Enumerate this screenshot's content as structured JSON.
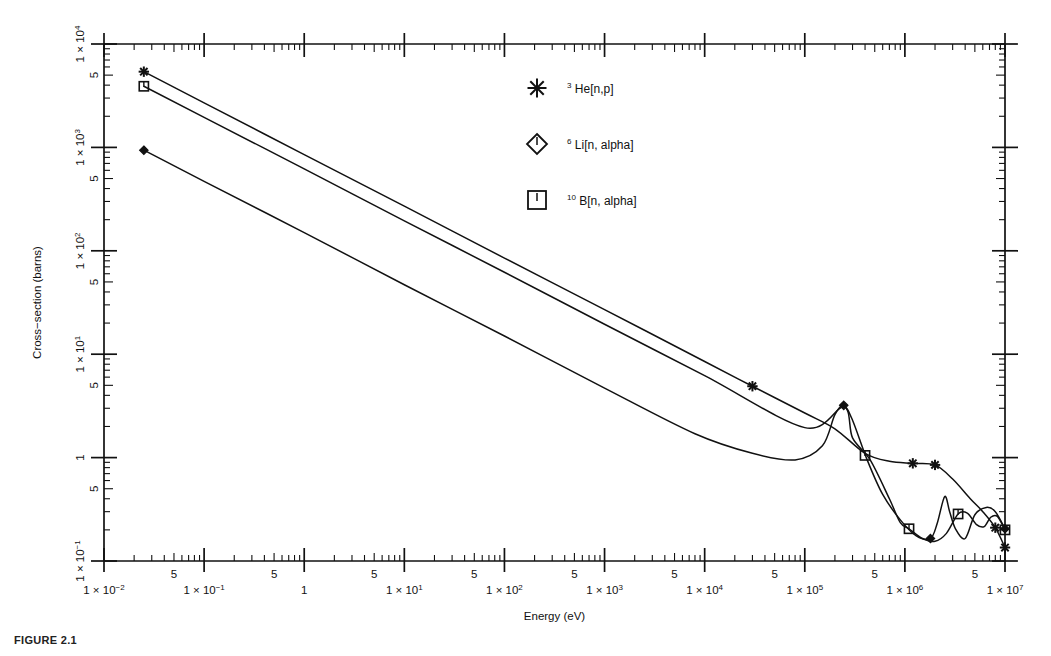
{
  "figure": {
    "caption": "FIGURE 2.1"
  },
  "axes": {
    "x": {
      "title": "Energy  (eV)",
      "min_exp": -2,
      "max_exp": 7,
      "scale": "log",
      "decade_labels": [
        {
          "exp": -2,
          "text": "1 × 10",
          "sup": "−2"
        },
        {
          "exp": -1,
          "text": "1 × 10",
          "sup": "−1"
        },
        {
          "exp": 0,
          "text": "1",
          "sup": ""
        },
        {
          "exp": 1,
          "text": "1 × 10",
          "sup": "1"
        },
        {
          "exp": 2,
          "text": "1 × 10",
          "sup": "2"
        },
        {
          "exp": 3,
          "text": "1 × 10",
          "sup": "3"
        },
        {
          "exp": 4,
          "text": "1 × 10",
          "sup": "4"
        },
        {
          "exp": 5,
          "text": "1 × 10",
          "sup": "5"
        },
        {
          "exp": 6,
          "text": "1 × 10",
          "sup": "6"
        },
        {
          "exp": 7,
          "text": "1 × 10",
          "sup": "7"
        }
      ],
      "minor_label": "5"
    },
    "y": {
      "title": "Cross−section (barns)",
      "min_exp": -1,
      "max_exp": 4,
      "scale": "log",
      "decade_labels": [
        {
          "exp": 4,
          "text": "1 × 10",
          "sup": "4"
        },
        {
          "exp": 3,
          "text": "1 × 10",
          "sup": "3"
        },
        {
          "exp": 2,
          "text": "1 × 10",
          "sup": "2"
        },
        {
          "exp": 1,
          "text": "1 × 10",
          "sup": "1"
        },
        {
          "exp": 0,
          "text": "1",
          "sup": ""
        },
        {
          "exp": -1,
          "text": "1 × 10",
          "sup": "−1"
        }
      ],
      "minor_label": "5"
    }
  },
  "legend": {
    "items": [
      {
        "marker": "asterisk-marker",
        "pre": "3",
        "label": "He[n,p]"
      },
      {
        "marker": "diamond-marker",
        "pre": "6",
        "label": "Li[n, alpha]"
      },
      {
        "marker": "square-marker",
        "pre": "10",
        "label": "B[n, alpha]"
      }
    ]
  },
  "chart_data": {
    "type": "line",
    "title": "",
    "xlabel": "Energy  (eV)",
    "ylabel": "Cross−section (barns)",
    "xscale": "log",
    "yscale": "log",
    "xlim": [
      0.01,
      10000000
    ],
    "ylim": [
      0.1,
      10000
    ],
    "grid": false,
    "legend_position": "upper-center",
    "series": [
      {
        "name": "3He[n,p]",
        "marker": "asterisk",
        "points": [
          [
            0.025,
            5400
          ],
          [
            0.1,
            2700
          ],
          [
            1,
            850
          ],
          [
            10,
            270
          ],
          [
            100,
            85
          ],
          [
            1000,
            27
          ],
          [
            10000,
            8.5
          ],
          [
            30000,
            4.9
          ],
          [
            100000,
            2.7
          ],
          [
            200000,
            1.9
          ],
          [
            400000,
            1.1
          ],
          [
            700000,
            0.92
          ],
          [
            1200000,
            0.88
          ],
          [
            2000000,
            0.85
          ],
          [
            3000000,
            0.62
          ],
          [
            4500000,
            0.4
          ],
          [
            6000000,
            0.3
          ],
          [
            8000000,
            0.21
          ],
          [
            10000000,
            0.135
          ]
        ],
        "marker_points": [
          [
            0.025,
            5400
          ],
          [
            30000,
            4.9
          ],
          [
            1200000,
            0.88
          ],
          [
            2000000,
            0.85
          ],
          [
            8000000,
            0.21
          ],
          [
            10000000,
            0.135
          ]
        ]
      },
      {
        "name": "6Li[n, alpha]",
        "marker": "diamond",
        "points": [
          [
            0.025,
            940
          ],
          [
            0.1,
            470
          ],
          [
            1,
            150
          ],
          [
            10,
            47
          ],
          [
            100,
            15
          ],
          [
            1000,
            4.7
          ],
          [
            8000,
            1.7
          ],
          [
            30000,
            1.1
          ],
          [
            80000,
            0.95
          ],
          [
            150000,
            1.3
          ],
          [
            200000,
            2.6
          ],
          [
            245000,
            3.2
          ],
          [
            300000,
            2.3
          ],
          [
            420000,
            0.95
          ],
          [
            600000,
            0.44
          ],
          [
            900000,
            0.25
          ],
          [
            1300000,
            0.175
          ],
          [
            1800000,
            0.165
          ],
          [
            2100000,
            0.23
          ],
          [
            2500000,
            0.42
          ],
          [
            2800000,
            0.3
          ],
          [
            3200000,
            0.205
          ],
          [
            4000000,
            0.165
          ],
          [
            5000000,
            0.28
          ],
          [
            6500000,
            0.33
          ],
          [
            8000000,
            0.3
          ],
          [
            10000000,
            0.205
          ]
        ],
        "marker_points": [
          [
            0.025,
            940
          ],
          [
            245000,
            3.2
          ],
          [
            1800000,
            0.165
          ],
          [
            10000000,
            0.205
          ]
        ]
      },
      {
        "name": "10B[n, alpha]",
        "marker": "square",
        "points": [
          [
            0.025,
            3900
          ],
          [
            0.1,
            1950
          ],
          [
            1,
            620
          ],
          [
            10,
            195
          ],
          [
            100,
            62
          ],
          [
            1000,
            19.5
          ],
          [
            10000,
            6.2
          ],
          [
            100000,
            1.95
          ],
          [
            245000,
            3.1
          ],
          [
            300000,
            1.55
          ],
          [
            450000,
            0.95
          ],
          [
            700000,
            0.4
          ],
          [
            900000,
            0.235
          ],
          [
            1100000,
            0.205
          ],
          [
            1500000,
            0.165
          ],
          [
            2000000,
            0.155
          ],
          [
            2600000,
            0.185
          ],
          [
            3400000,
            0.285
          ],
          [
            4200000,
            0.29
          ],
          [
            5200000,
            0.225
          ],
          [
            6200000,
            0.215
          ],
          [
            7200000,
            0.265
          ],
          [
            8400000,
            0.27
          ],
          [
            10000000,
            0.2
          ]
        ],
        "marker_points": [
          [
            0.025,
            3900
          ],
          [
            400000,
            1.05
          ],
          [
            1100000,
            0.205
          ],
          [
            3400000,
            0.285
          ],
          [
            10000000,
            0.2
          ]
        ]
      }
    ]
  }
}
